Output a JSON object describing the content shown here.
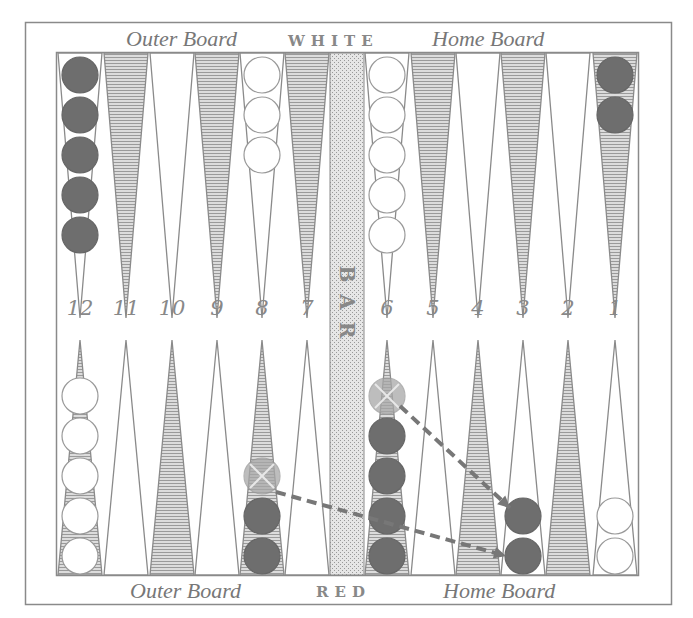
{
  "labels": {
    "top_left": "Outer Board",
    "top_center": "WHITE",
    "top_right": "Home Board",
    "bottom_left": "Outer Board",
    "bottom_center": "RED",
    "bottom_right": "Home Board",
    "bar": [
      "B",
      "A",
      "R"
    ]
  },
  "point_numbers": [
    "12",
    "11",
    "10",
    "9",
    "8",
    "7",
    "6",
    "5",
    "4",
    "3",
    "2",
    "1"
  ],
  "colors": {
    "frame": "#8a8a8a",
    "shaded_point": "#b0b0b0",
    "red_checker": "#6e6e6e",
    "red_checker_dark": "#555555",
    "white_checker": "#ffffff",
    "ghost_checker": "#a8a8a8",
    "bar_fill": "#d6d6d6",
    "arrow": "#777777"
  },
  "position": {
    "top": [
      {
        "point": 12,
        "color": "red",
        "count": 5
      },
      {
        "point": 8,
        "color": "white",
        "count": 3
      },
      {
        "point": 6,
        "color": "white",
        "count": 5
      },
      {
        "point": 1,
        "color": "red",
        "count": 2
      }
    ],
    "bottom": [
      {
        "point": 12,
        "color": "white",
        "count": 5
      },
      {
        "point": 8,
        "color": "red",
        "count": 2,
        "ghost": 1
      },
      {
        "point": 6,
        "color": "red",
        "count": 4,
        "ghost": 1
      },
      {
        "point": 3,
        "color": "red",
        "count": 2
      },
      {
        "point": 1,
        "color": "white",
        "count": 2
      }
    ]
  },
  "moves": [
    {
      "from": "8",
      "to": "3"
    },
    {
      "from": "6",
      "to": "3"
    }
  ]
}
